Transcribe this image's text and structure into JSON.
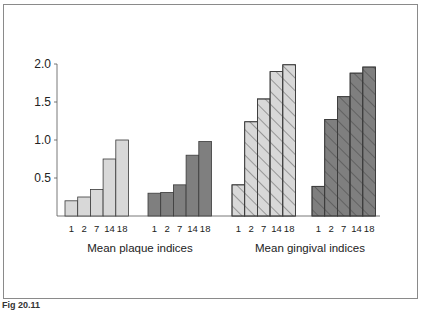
{
  "chart_data": {
    "type": "bar",
    "title": "",
    "xlabel": "",
    "ylabel": "",
    "ylim": [
      0,
      2.0
    ],
    "yticks": [
      "0.5",
      "1.0",
      "1.5",
      "2.0"
    ],
    "grid": false,
    "categories": [
      "1",
      "2",
      "7",
      "14",
      "18"
    ],
    "group_labels": [
      "Mean plaque indices",
      "Mean gingival indices"
    ],
    "series": [
      {
        "name": "Mean plaque indices - group A",
        "group": "Mean plaque indices",
        "fill": "#d8d8d8",
        "hatch": false,
        "values": [
          0.2,
          0.25,
          0.35,
          0.75,
          1.0
        ]
      },
      {
        "name": "Mean plaque indices - group B",
        "group": "Mean plaque indices",
        "fill": "#7f7f7f",
        "hatch": false,
        "values": [
          0.3,
          0.31,
          0.41,
          0.8,
          0.98
        ]
      },
      {
        "name": "Mean gingival indices - group A",
        "group": "Mean gingival indices",
        "fill": "#d8d8d8",
        "hatch": true,
        "values": [
          0.41,
          1.24,
          1.54,
          1.9,
          1.99
        ]
      },
      {
        "name": "Mean gingival indices - group B",
        "group": "Mean gingival indices",
        "fill": "#7f7f7f",
        "hatch": true,
        "values": [
          0.39,
          1.27,
          1.57,
          1.88,
          1.96
        ]
      }
    ]
  },
  "caption": "Fig 20.11"
}
